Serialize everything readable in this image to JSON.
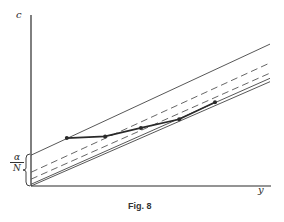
{
  "figure": {
    "caption": "Fig. 8",
    "y_axis_label": "c",
    "x_axis_label": "y",
    "intercept_label": {
      "numerator": "α",
      "denominator": "N"
    }
  },
  "chart_data": {
    "type": "line",
    "title": "Fig. 8",
    "xlabel": "y",
    "ylabel": "c",
    "grid": false,
    "ticks": false,
    "annotations": [
      {
        "text": "α/N",
        "description": "brace on the c-axis marking the intercept height of the top solid line"
      }
    ],
    "series": [
      {
        "name": "upper solid line",
        "style": "solid",
        "x": [
          0,
          1
        ],
        "y": [
          0.18,
          0.83
        ]
      },
      {
        "name": "upper dashed line",
        "style": "dashed",
        "x": [
          0,
          1
        ],
        "y": [
          0.08,
          0.72
        ]
      },
      {
        "name": "lower dashed line",
        "style": "dashed",
        "x": [
          0,
          1
        ],
        "y": [
          0.04,
          0.66
        ]
      },
      {
        "name": "lower double solid line (a)",
        "style": "solid",
        "x": [
          0,
          1
        ],
        "y": [
          0.01,
          0.63
        ]
      },
      {
        "name": "lower double solid line (b)",
        "style": "solid",
        "x": [
          0,
          1
        ],
        "y": [
          0.0,
          0.61
        ]
      },
      {
        "name": "bold path with points",
        "style": "bold-solid-markers",
        "x": [
          0.15,
          0.31,
          0.46,
          0.62,
          0.77
        ],
        "y": [
          0.28,
          0.29,
          0.34,
          0.39,
          0.49
        ]
      }
    ]
  },
  "colors": {
    "ink": "#2a2a2a",
    "background": "#ffffff"
  }
}
